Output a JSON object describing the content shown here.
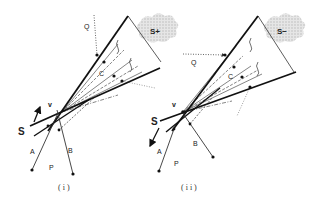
{
  "figure": {
    "panels": [
      {
        "id": "i",
        "caption": "(i)",
        "labels": {
          "Q": "Q",
          "C": "C",
          "S": "S",
          "V": "v",
          "A": "A",
          "B": "B",
          "P": "P",
          "region": "S+"
        }
      },
      {
        "id": "ii",
        "caption": "(ii)",
        "labels": {
          "Q": "Q",
          "C": "C",
          "S": "S",
          "V": "v",
          "A": "A",
          "B": "B",
          "P": "P",
          "region": "S−"
        }
      }
    ],
    "colors": {
      "line": "#111111",
      "dotted": "#555555",
      "cloud": "#cfcfcf"
    }
  }
}
